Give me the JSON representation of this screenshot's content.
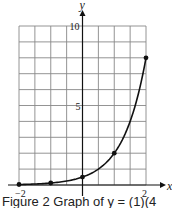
{
  "chart_data": {
    "type": "line",
    "title": "",
    "xlabel": "x",
    "ylabel": "y",
    "xlim": [
      -2,
      2
    ],
    "ylim": [
      0,
      10
    ],
    "grid": true,
    "x_ticks": [
      {
        "value": -2,
        "label": "−2"
      },
      {
        "value": 2,
        "label": "2"
      }
    ],
    "y_ticks": [
      {
        "value": 5,
        "label": "5"
      },
      {
        "value": 10,
        "label": "10"
      }
    ],
    "series": [
      {
        "name": "curve",
        "points": [
          {
            "x": -2,
            "y": 0.03125
          },
          {
            "x": -1,
            "y": 0.125
          },
          {
            "x": 0,
            "y": 0.5
          },
          {
            "x": 1,
            "y": 2
          },
          {
            "x": 2,
            "y": 8
          }
        ]
      }
    ],
    "caption": "Figure 2  Graph of y = (1)(4)ˣ"
  },
  "caption": "Figure 2   Graph of y = (1)(4"
}
